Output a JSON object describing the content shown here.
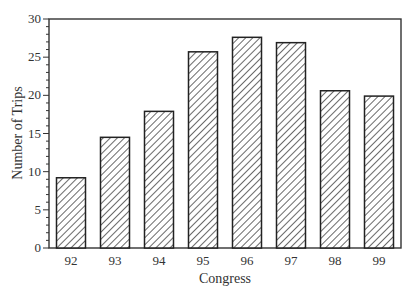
{
  "chart_data": {
    "type": "bar",
    "title": "",
    "xlabel": "Congress",
    "ylabel": "Number of Trips",
    "categories": [
      "92",
      "93",
      "94",
      "95",
      "96",
      "97",
      "98",
      "99"
    ],
    "values": [
      9.2,
      14.5,
      17.9,
      25.7,
      27.6,
      26.9,
      20.6,
      19.9
    ],
    "ylim": [
      0,
      30
    ],
    "yticks": [
      0,
      5,
      10,
      15,
      20,
      25,
      30
    ],
    "minor_tick_step": 1,
    "grid": false,
    "legend": null,
    "bar_fill": "diagonal-hatch",
    "colors": {
      "bar_edge": "#222222",
      "hatch": "#444444",
      "axis": "#333333",
      "background": "#ffffff"
    }
  }
}
